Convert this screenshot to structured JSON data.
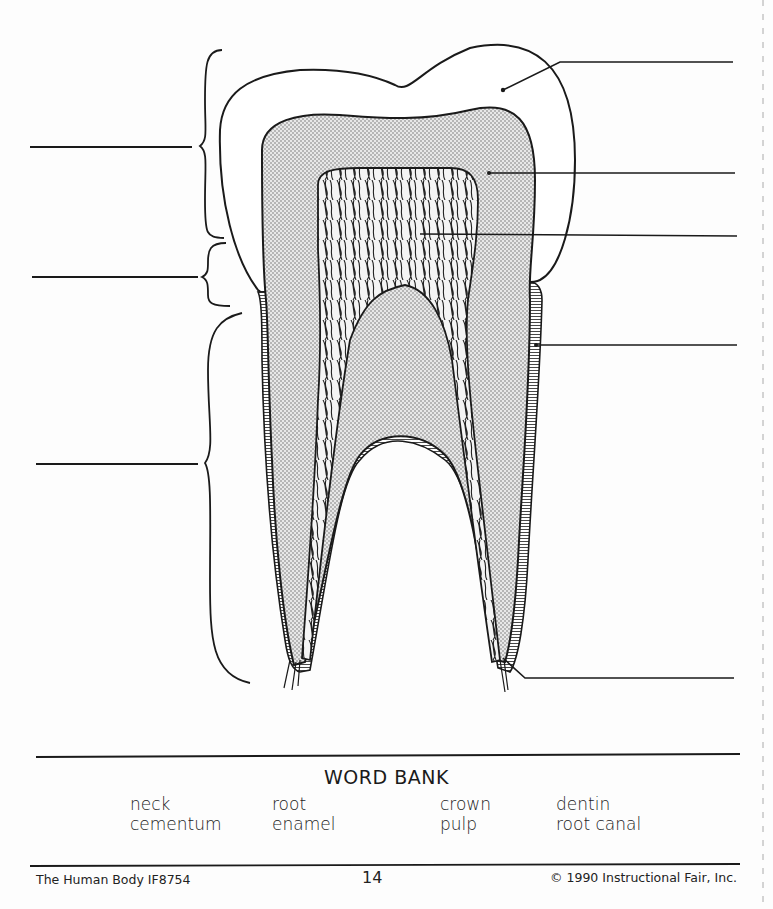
{
  "worksheet": {
    "subject": "Tooth anatomy labeling diagram",
    "label_blanks": {
      "left": 3,
      "right": 5
    }
  },
  "word_bank": {
    "title": "WORD BANK",
    "words": [
      "neck",
      "root",
      "crown",
      "dentin",
      "cementum",
      "enamel",
      "pulp",
      "root canal"
    ]
  },
  "footer": {
    "left": "The Human Body IF8754",
    "page_number": "14",
    "right": "© 1990 Instructional Fair, Inc."
  },
  "colors": {
    "ink": "#1a1a1a",
    "paper": "#fdfdfd",
    "dentin_stipple": "#bdbdbd"
  }
}
